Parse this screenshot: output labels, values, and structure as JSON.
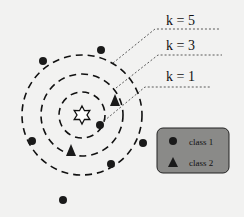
{
  "labels": {
    "k5": "k = 5",
    "k3": "k = 3",
    "k1": "k = 1"
  },
  "legend": {
    "class1": "class 1",
    "class2": "class 2"
  },
  "colors": {
    "legend_bg": "#8a8a88",
    "ink": "#111111"
  },
  "query_point": {
    "symbol": "star",
    "x": 82,
    "y": 115
  },
  "points": {
    "class1": [
      [
        101,
        50
      ],
      [
        43,
        61
      ],
      [
        100,
        125
      ],
      [
        32,
        141
      ],
      [
        143,
        143
      ],
      [
        111,
        164
      ],
      [
        63,
        200
      ]
    ],
    "class2": [
      [
        115,
        100
      ],
      [
        71,
        150
      ]
    ]
  },
  "radii": {
    "k1": 23,
    "k3": 41,
    "k5": 60
  }
}
